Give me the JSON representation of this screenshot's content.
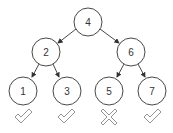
{
  "diagram": {
    "type": "binary-search-tree",
    "nodes": [
      {
        "id": "n4",
        "label": "4",
        "cx": 88,
        "cy": 22
      },
      {
        "id": "n2",
        "label": "2",
        "cx": 46,
        "cy": 52
      },
      {
        "id": "n6",
        "label": "6",
        "cx": 131,
        "cy": 52
      },
      {
        "id": "n1",
        "label": "1",
        "cx": 23,
        "cy": 91
      },
      {
        "id": "n3",
        "label": "3",
        "cx": 67,
        "cy": 91
      },
      {
        "id": "n5",
        "label": "5",
        "cx": 109,
        "cy": 91
      },
      {
        "id": "n7",
        "label": "7",
        "cx": 152,
        "cy": 91
      }
    ],
    "edges": [
      {
        "from": "4",
        "to": "2"
      },
      {
        "from": "4",
        "to": "6"
      },
      {
        "from": "2",
        "to": "1"
      },
      {
        "from": "2",
        "to": "3"
      },
      {
        "from": "6",
        "to": "5"
      },
      {
        "from": "6",
        "to": "7"
      }
    ],
    "marks": [
      {
        "under": "1",
        "icon": "check-icon"
      },
      {
        "under": "3",
        "icon": "check-icon"
      },
      {
        "under": "5",
        "icon": "cross-icon"
      },
      {
        "under": "7",
        "icon": "check-icon"
      }
    ],
    "colors": {
      "stroke": "#333333",
      "mark": "#888888"
    }
  }
}
